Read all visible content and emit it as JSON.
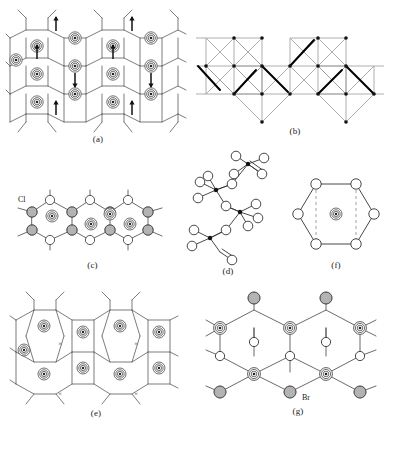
{
  "figure": {
    "type": "crystal-structure-diagram-sheet",
    "background": "#ffffff",
    "line_color": "#333333",
    "bold_color": "#000000",
    "gray_fill": "#b3b3b3",
    "white_fill": "#ffffff",
    "width": 399,
    "height": 458
  },
  "panels": [
    {
      "id": "a",
      "caption": "(a)",
      "description": "pentagonal tiling net with bullseye sites and vertical arrow markers",
      "motifs": [
        "pentagon-net",
        "bullseye-site",
        "arrow-marker"
      ],
      "bullseye_count": 13,
      "arrow_count": 8
    },
    {
      "id": "b",
      "caption": "(b)",
      "description": "zig-zag chain of edge-sharing squares with diagonals, selected edges bold",
      "motifs": [
        "square-net",
        "diagonal-cross",
        "bold-edge",
        "vertex-dot"
      ],
      "square_count": 12,
      "bold_edge_count": 6
    },
    {
      "id": "c",
      "caption": "(c)",
      "description": "fused ring chain with shaded halogen atoms, open atoms and bullseye ring centres",
      "motifs": [
        "fused-rings",
        "gray-atom",
        "white-atom",
        "bullseye-site"
      ],
      "label": "Cl",
      "ring_count": 4
    },
    {
      "id": "d",
      "caption": "(d)",
      "description": "chain of corner-linked tetrahedra drawn as filled centres with open ligands",
      "motifs": [
        "tetrahedral-centre",
        "white-atom",
        "bridging-atom"
      ],
      "centre_count": 4
    },
    {
      "id": "f",
      "caption": "(f)",
      "description": "hexagonal ring of six open atoms with central bullseye site and dashed guides",
      "motifs": [
        "hexagon-ring",
        "white-atom",
        "bullseye-site",
        "dashed-guide"
      ],
      "vertex_count": 6
    },
    {
      "id": "e",
      "caption": "(e)",
      "description": "pentagon net with bullseye sites; vacant hexagonal cavities marked with crosses",
      "motifs": [
        "pentagon-net",
        "bullseye-site",
        "cross-marker"
      ],
      "bullseye_count": 9,
      "cross_count": 4
    },
    {
      "id": "g",
      "caption": "(g)",
      "description": "honeycomb sheet with shaded halogen atoms, open atoms and bullseye metal sites",
      "motifs": [
        "honeycomb-net",
        "gray-atom",
        "white-atom",
        "bullseye-site"
      ],
      "label": "Br",
      "bullseye_count": 5
    }
  ],
  "labels": {
    "panel_a": "(a)",
    "panel_b": "(b)",
    "panel_c": "(c)",
    "panel_d": "(d)",
    "panel_e": "(e)",
    "panel_f": "(f)",
    "panel_g": "(g)",
    "chlorine": "Cl",
    "bromine": "Br",
    "cross": "×"
  }
}
